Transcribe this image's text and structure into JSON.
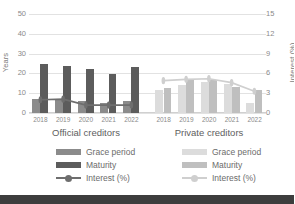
{
  "chart_data": {
    "type": "bar",
    "title": "",
    "subtitle": "",
    "categories": [
      "2018",
      "2019",
      "2020",
      "2021",
      "2022"
    ],
    "panels": [
      {
        "name": "Official creditors",
        "label": "Official creditors",
        "series": [
          {
            "name": "Grace period",
            "type": "bar",
            "axis": "left",
            "color": "#8b8b8b",
            "values": [
              7.0,
              6.8,
              6.0,
              5.2,
              6.3
            ]
          },
          {
            "name": "Maturity",
            "type": "bar",
            "axis": "left",
            "color": "#5c5c5c",
            "values": [
              25.0,
              23.5,
              22.0,
              19.7,
              23.0
            ]
          },
          {
            "name": "Interest (%)",
            "type": "line",
            "axis": "right",
            "color": "#6e6e6e",
            "values": [
              2.0,
              2.1,
              1.2,
              1.2,
              1.2
            ]
          }
        ]
      },
      {
        "name": "Private creditors",
        "label": "Private creditors",
        "series": [
          {
            "name": "Grace period",
            "type": "bar",
            "axis": "left",
            "color": "#dcdcdc",
            "values": [
              11.7,
              14.2,
              15.5,
              14.9,
              5.3
            ]
          },
          {
            "name": "Maturity",
            "type": "bar",
            "axis": "left",
            "color": "#bfbfbf",
            "values": [
              12.7,
              16.5,
              16.8,
              13.2,
              11.4
            ]
          },
          {
            "name": "Interest (%)",
            "type": "line",
            "axis": "right",
            "color": "#cfcfcf",
            "values": [
              4.9,
              5.1,
              5.2,
              4.6,
              3.3
            ]
          }
        ]
      }
    ],
    "ylabel": "Years",
    "y2label": "Interest (%)",
    "xlabel": "",
    "ylim": [
      0,
      50
    ],
    "y2lim": [
      0,
      15
    ],
    "yticks": [
      "0",
      "10",
      "20",
      "30",
      "40",
      "50"
    ],
    "y2ticks": [
      "0",
      "3",
      "6",
      "9",
      "12",
      "15"
    ],
    "grid": true,
    "legend_position": "bottom"
  },
  "legends": {
    "official": {
      "grace_label": "Grace period",
      "maturity_label": "Maturity",
      "interest_label": "Interest (%)"
    },
    "private": {
      "grace_label": "Grace period",
      "maturity_label": "Maturity",
      "interest_label": "Interest (%)"
    }
  }
}
